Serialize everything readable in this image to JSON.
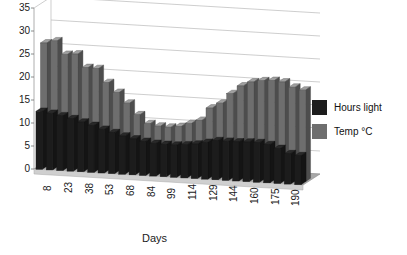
{
  "chart_data": {
    "type": "bar",
    "title": "",
    "xlabel": "Days",
    "ylabel": "",
    "ylim": [
      0,
      35
    ],
    "ytick_step": 5,
    "yticks": [
      0,
      5,
      10,
      15,
      20,
      25,
      30,
      35
    ],
    "grid": true,
    "projection": "3d-perspective",
    "legend_position": "right",
    "categories": [
      8,
      15,
      23,
      30,
      38,
      45,
      53,
      61,
      68,
      76,
      84,
      91,
      99,
      107,
      114,
      122,
      129,
      137,
      144,
      152,
      160,
      168,
      175,
      183,
      190,
      198
    ],
    "xtick_labels": [
      "8",
      "23",
      "38",
      "53",
      "68",
      "84",
      "99",
      "114",
      "129",
      "144",
      "160",
      "175",
      "190"
    ],
    "series": [
      {
        "name": "Hours light",
        "color": "#1c1c1c",
        "values": [
          12.6,
          12.3,
          11.9,
          11.4,
          10.8,
          10.2,
          9.5,
          8.9,
          8.3,
          7.8,
          7.4,
          7.1,
          7.0,
          7.0,
          7.2,
          7.5,
          8.0,
          8.5,
          8.5,
          8.5,
          8.6,
          8.6,
          8.3,
          7.6,
          6.6,
          6.3
        ]
      },
      {
        "name": "Temp °C",
        "color": "#6e6e6e",
        "values": [
          26.8,
          27.4,
          24.6,
          24.8,
          22.0,
          21.9,
          19.0,
          17.0,
          14.8,
          12.4,
          10.6,
          10.2,
          10.1,
          10.4,
          11.2,
          12.0,
          14.8,
          16.0,
          18.2,
          20.0,
          21.0,
          21.4,
          21.6,
          21.4,
          20.4,
          19.9
        ]
      }
    ]
  },
  "legend": {
    "items": [
      {
        "label": "Hours light",
        "color": "#1c1c1c",
        "swatch_name": "legend-swatch-hours-light"
      },
      {
        "label": "Temp °C",
        "color": "#6e6e6e",
        "swatch_name": "legend-swatch-temp"
      }
    ]
  }
}
